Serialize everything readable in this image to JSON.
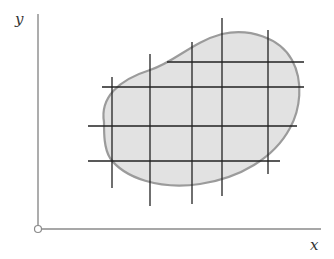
{
  "figure": {
    "type": "region-grid-partition",
    "axes": {
      "x_label": "x",
      "y_label": "y",
      "origin_marker": "open-circle",
      "color": "#8a8a8a"
    },
    "region": {
      "fill": "#e2e2e2",
      "stroke": "#9b9b9b",
      "description": "irregular blob-shaped region"
    },
    "grid": {
      "color": "#222222",
      "vertical_lines": [
        {
          "x": 112,
          "y1": 77,
          "y2": 188
        },
        {
          "x": 150,
          "y1": 54,
          "y2": 206
        },
        {
          "x": 192,
          "y1": 42,
          "y2": 204
        },
        {
          "x": 222,
          "y1": 18,
          "y2": 196
        },
        {
          "x": 268,
          "y1": 30,
          "y2": 174
        }
      ],
      "horizontal_lines": [
        {
          "y": 62,
          "x1": 167,
          "x2": 304
        },
        {
          "y": 87,
          "x1": 102,
          "x2": 304
        },
        {
          "y": 126,
          "x1": 88,
          "x2": 297
        },
        {
          "y": 161,
          "x1": 88,
          "x2": 280
        }
      ]
    }
  }
}
